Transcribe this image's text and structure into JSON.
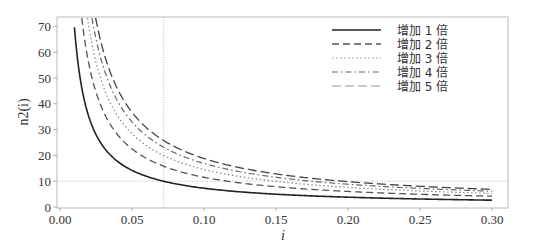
{
  "chart_data": {
    "type": "line",
    "title": "",
    "xlabel": "i",
    "ylabel": "n2(i)",
    "xlim": [
      0.0,
      0.31
    ],
    "ylim": [
      0,
      72
    ],
    "grid": false,
    "legend_position": "upper right",
    "x_ticks": [
      "0.00",
      "0.05",
      "0.10",
      "0.15",
      "0.20",
      "0.25",
      "0.30"
    ],
    "y_ticks": [
      "0",
      "10",
      "20",
      "30",
      "40",
      "50",
      "60",
      "70"
    ],
    "x": [
      0.01,
      0.02,
      0.03,
      0.04,
      0.05,
      0.06,
      0.072,
      0.08,
      0.1,
      0.12,
      0.15,
      0.2,
      0.25,
      0.3
    ],
    "series": [
      {
        "name": "增加 1 倍",
        "style": "solid",
        "color": "#222222",
        "values": [
          69.66,
          35.0,
          23.45,
          17.67,
          14.21,
          11.9,
          9.97,
          9.01,
          7.27,
          6.12,
          4.96,
          3.8,
          3.11,
          2.64
        ]
      },
      {
        "name": "增加 2 倍",
        "style": "dashed",
        "color": "#555555",
        "values": [
          110.4,
          55.5,
          37.17,
          28.0,
          22.5,
          18.85,
          15.8,
          14.27,
          11.53,
          9.69,
          7.86,
          6.03,
          4.92,
          4.19
        ]
      },
      {
        "name": "增加 3 倍",
        "style": "dotted",
        "color": "#888888",
        "values": [
          139.3,
          70.0,
          46.9,
          35.3,
          28.4,
          23.8,
          19.94,
          18.0,
          14.55,
          12.23,
          9.92,
          7.6,
          6.21,
          5.28
        ]
      },
      {
        "name": "增加 4 倍",
        "style": "dashdot",
        "color": "#666666",
        "values": [
          161.7,
          81.3,
          54.4,
          41.0,
          33.0,
          27.6,
          23.1,
          20.9,
          16.9,
          14.2,
          11.5,
          8.83,
          7.21,
          6.13
        ]
      },
      {
        "name": "增加 5 倍",
        "style": "longdash",
        "color": "#444444",
        "values": [
          180.0,
          90.5,
          60.6,
          45.7,
          36.7,
          30.7,
          25.8,
          23.3,
          18.8,
          15.8,
          12.8,
          9.83,
          8.03,
          6.83
        ]
      }
    ],
    "reference_lines": [
      {
        "orientation": "vertical",
        "x": 0.072
      },
      {
        "orientation": "horizontal",
        "y": 10
      }
    ]
  }
}
